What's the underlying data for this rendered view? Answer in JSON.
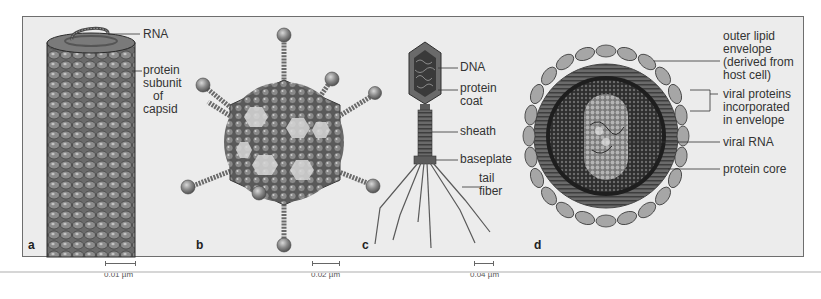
{
  "figure": {
    "panels": [
      {
        "letter": "a",
        "labels": [
          "RNA",
          "protein subunit of capsid"
        ],
        "scale": "0.01 µm"
      },
      {
        "letter": "b",
        "labels": [],
        "scale": "0.02 µm"
      },
      {
        "letter": "c",
        "labels": [
          "DNA",
          "protein coat",
          "sheath",
          "baseplate",
          "tail fiber"
        ],
        "scale": "0.04 µm"
      },
      {
        "letter": "d",
        "labels": [
          "outer lipid envelope (derived from host cell)",
          "viral proteins incorporated in envelope",
          "viral RNA",
          "protein core"
        ]
      }
    ],
    "a": {
      "rna": "RNA",
      "capsid_l1": "protein",
      "capsid_l2": "subunit",
      "capsid_l3": "of",
      "capsid_l4": "capsid",
      "letter": "a",
      "scale": "0.01 µm"
    },
    "b": {
      "letter": "b",
      "scale": "0.02 µm"
    },
    "c": {
      "dna": "DNA",
      "coat_l1": "protein",
      "coat_l2": "coat",
      "sheath": "sheath",
      "baseplate": "baseplate",
      "tail_l1": "tail",
      "tail_l2": "fiber",
      "letter": "c",
      "scale": "0.04 µm"
    },
    "d": {
      "env_l1": "outer lipid",
      "env_l2": "envelope",
      "env_l3": "(derived from",
      "env_l4": "host cell)",
      "vp_l1": "viral proteins",
      "vp_l2": "incorporated",
      "vp_l3": "in envelope",
      "rna": "viral RNA",
      "core": "protein core",
      "letter": "d"
    },
    "colors": {
      "panel_bg": "#ececec",
      "panel_border": "#6e6e6e",
      "virus_dark": "#5e5e5e",
      "virus_mid": "#8a8a8a",
      "virus_light": "#c8c8c8",
      "leader_line": "#333333"
    }
  }
}
